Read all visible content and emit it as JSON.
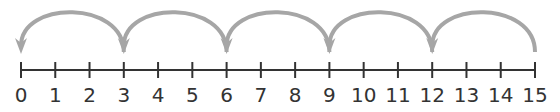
{
  "diagram": {
    "type": "number-line-jumps",
    "start": 0,
    "end": 15,
    "step": 1,
    "jump_size": 3,
    "jump_direction": "backward",
    "jumps": [
      {
        "from": 15,
        "to": 12
      },
      {
        "from": 12,
        "to": 9
      },
      {
        "from": 9,
        "to": 6
      },
      {
        "from": 6,
        "to": 3
      },
      {
        "from": 3,
        "to": 0
      }
    ],
    "tick_labels": [
      "0",
      "1",
      "2",
      "3",
      "4",
      "5",
      "6",
      "7",
      "8",
      "9",
      "10",
      "11",
      "12",
      "13",
      "14",
      "15"
    ],
    "colors": {
      "line": "#333333",
      "arrow": "#a6a6a6",
      "text": "#333333"
    }
  }
}
